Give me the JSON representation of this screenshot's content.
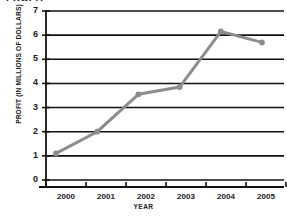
{
  "figure": {
    "clipped_top_text": "PROFIT",
    "background_color": "#ffffff"
  },
  "chart_data": {
    "type": "line",
    "title": "",
    "xlabel": "YEAR",
    "ylabel": "PROFIT (IN MILLIONS OF DOLLARS)",
    "categories": [
      "2000",
      "2001",
      "2002",
      "2003",
      "2004",
      "2005"
    ],
    "x": [
      2000,
      2001,
      2002,
      2003,
      2004,
      2005
    ],
    "values": [
      1.1,
      2.0,
      3.55,
      3.85,
      6.15,
      5.7
    ],
    "series": [
      {
        "name": "Profit",
        "values": [
          1.1,
          2.0,
          3.55,
          3.85,
          6.15,
          5.7
        ]
      }
    ],
    "ylim": [
      0,
      7
    ],
    "xlim": [
      2000,
      2005
    ],
    "yticks": [
      0,
      1,
      2,
      3,
      4,
      5,
      6,
      7
    ],
    "ytick_labels": [
      "0",
      "1",
      "2",
      "3",
      "4",
      "5",
      "6",
      "7"
    ],
    "xtick_labels": [
      "2000",
      "2001",
      "2002",
      "2003",
      "2004",
      "2005"
    ],
    "grid": true,
    "grid_orientation": "horizontal",
    "legend": false,
    "legend_position": "none",
    "line_color": "#8c8c8c",
    "marker": "circle",
    "marker_color": "#8c8c8c",
    "axis_color": "#111111",
    "grid_color": "#111111"
  }
}
